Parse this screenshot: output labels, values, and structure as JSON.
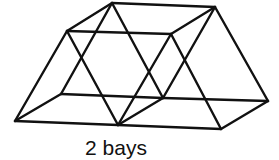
{
  "figure": {
    "caption": "2 bays",
    "stroke_color": "#111111",
    "background": "#ffffff"
  },
  "structure": {
    "type": "truss-frame",
    "bays": 2,
    "vertices": {
      "TBL": [
        112,
        3
      ],
      "TBR": [
        215,
        7
      ],
      "TFL": [
        67,
        31
      ],
      "TFR": [
        171,
        34
      ],
      "BFL": [
        15,
        121
      ],
      "BFM": [
        118,
        125
      ],
      "BFR": [
        221,
        129
      ],
      "BBL": [
        61,
        94
      ],
      "BBM": [
        163,
        98
      ],
      "BBR": [
        268,
        101
      ]
    },
    "edges": [
      [
        "TFL",
        "TBL"
      ],
      [
        "TBL",
        "TBR"
      ],
      [
        "TFL",
        "TFR"
      ],
      [
        "TFR",
        "TBR"
      ],
      [
        "TFL",
        "BFL"
      ],
      [
        "TFL",
        "BFM"
      ],
      [
        "TFR",
        "BFM"
      ],
      [
        "TFR",
        "BFR"
      ],
      [
        "TBL",
        "BBL"
      ],
      [
        "TBL",
        "BBM"
      ],
      [
        "TBR",
        "BBM"
      ],
      [
        "TBR",
        "BBR"
      ],
      [
        "BFL",
        "BFM"
      ],
      [
        "BFM",
        "BFR"
      ],
      [
        "BBL",
        "BBM"
      ],
      [
        "BBM",
        "BBR"
      ],
      [
        "BFL",
        "BBL"
      ],
      [
        "BFM",
        "BBM"
      ],
      [
        "BFR",
        "BBR"
      ]
    ]
  }
}
